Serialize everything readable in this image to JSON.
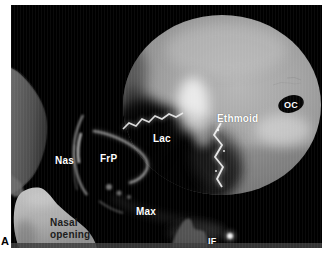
{
  "panel": {
    "label": "A"
  },
  "labels": {
    "ethmoid": "Ethmoid",
    "optic_canal": "OC",
    "lacrimal": "Lac",
    "nasal_bone": "Nas",
    "frontal_process": "FrP",
    "nasal_opening_line1": "Nasal",
    "nasal_opening_line2": "opening",
    "maxilla": "Max",
    "infraorbital_foramen": "IF"
  },
  "colors": {
    "page_background": "#ffffff",
    "photo_background": "#000000",
    "annotation_text": "#ffffff",
    "nasal_opening_text": "#1c1c1c",
    "panel_letter_text": "#000000",
    "bone_highlight": "#f2f2f2",
    "bone_light_gray": "#a8a8a8",
    "bone_mid_gray": "#8a8a8a",
    "bone_dark_gray": "#4a4a4a"
  }
}
